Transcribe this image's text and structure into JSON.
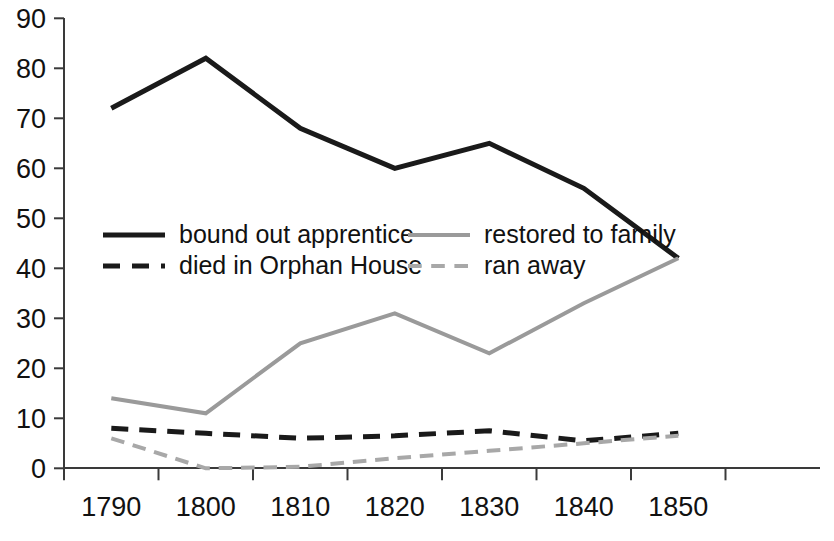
{
  "chart_data": {
    "type": "line",
    "title": "",
    "subtitle": "",
    "xlabel": "",
    "ylabel": "",
    "categories": [
      "1790",
      "1800",
      "1810",
      "1820",
      "1830",
      "1840",
      "1850"
    ],
    "x": [
      1790,
      1800,
      1810,
      1820,
      1830,
      1840,
      1850
    ],
    "ylim": [
      0,
      90
    ],
    "xlim": [
      1785,
      1855
    ],
    "y_ticks": [
      0,
      10,
      20,
      30,
      40,
      50,
      60,
      70,
      80,
      90
    ],
    "y_tick_labels": [
      "0",
      "10",
      "20",
      "30",
      "40",
      "50",
      "60",
      "70",
      "80",
      "90"
    ],
    "x_tick_labels": [
      "1790",
      "1800",
      "1810",
      "1820",
      "1830",
      "1840",
      "1850"
    ],
    "grid": false,
    "legend_position": "inside-upper-left",
    "series": [
      {
        "name": "bound out apprentice",
        "style": "solid",
        "color": "#1a1a1a",
        "width": 5,
        "values": [
          72,
          82,
          68,
          60,
          65,
          56,
          42
        ]
      },
      {
        "name": "restored to family",
        "style": "solid",
        "color": "#9a9a9a",
        "width": 4,
        "values": [
          14,
          11,
          25,
          31,
          23,
          33,
          42
        ]
      },
      {
        "name": "died in Orphan House",
        "style": "dashed",
        "color": "#1a1a1a",
        "width": 5,
        "values": [
          8,
          7,
          6,
          6.5,
          7.5,
          5.5,
          7
        ]
      },
      {
        "name": "ran away",
        "style": "dashed",
        "color": "#a8a8a8",
        "width": 4,
        "values": [
          6,
          0,
          0.3,
          2,
          3.5,
          5,
          6.5
        ]
      }
    ]
  },
  "legend": {
    "entries": [
      {
        "label": "bound out apprentice",
        "color": "#1a1a1a",
        "style": "solid"
      },
      {
        "label": "restored to family",
        "color": "#9a9a9a",
        "style": "solid"
      },
      {
        "label": "died in Orphan House",
        "color": "#1a1a1a",
        "style": "dashed"
      },
      {
        "label": "ran away",
        "color": "#a8a8a8",
        "style": "dashed"
      }
    ]
  },
  "axes": {
    "y_labels": [
      "90",
      "80",
      "70",
      "60",
      "50",
      "40",
      "30",
      "20",
      "10",
      "0"
    ],
    "x_labels": [
      "1790",
      "1800",
      "1810",
      "1820",
      "1830",
      "1840",
      "1850"
    ]
  },
  "colors": {
    "background": "#ffffff",
    "axis": "#3a3a3a",
    "text": "#111111",
    "series_dark": "#1a1a1a",
    "series_light": "#9a9a9a"
  }
}
